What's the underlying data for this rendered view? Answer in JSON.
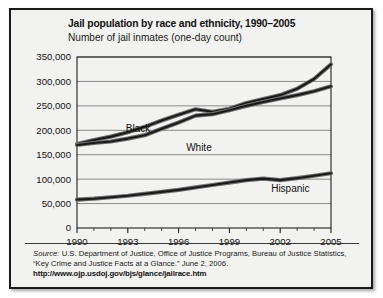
{
  "figure": {
    "title": "Jail population by race and ethnicity, 1990–2005",
    "subtitle": "Number of jail inmates (one-day count)"
  },
  "source": {
    "label": "Source:",
    "text": " U.S. Department of Justice, Office of Justice Programs, Bureau of Justice Statistics, “Key Crime and Justice Facts at a Glance.” June 2, 2006.",
    "url": "http://www.ojp.usdoj.gov/bjs/glance/jailrace.htm"
  },
  "chart_data": {
    "type": "line",
    "title": "Jail population by race and ethnicity, 1990–2005",
    "subtitle": "Number of jail inmates (one-day count)",
    "xlabel": "",
    "ylabel": "Number of jail inmates (one-day count)",
    "x": [
      1990,
      1991,
      1992,
      1993,
      1994,
      1995,
      1996,
      1997,
      1998,
      1999,
      2000,
      2001,
      2002,
      2003,
      2004,
      2005
    ],
    "xticks": [
      1990,
      1993,
      1996,
      1999,
      2002,
      2005
    ],
    "xtick_labels": [
      "1990",
      "1993",
      "1996",
      "1999",
      "2002",
      "2005"
    ],
    "xlim": [
      1990,
      2005
    ],
    "yticks": [
      0,
      50000,
      100000,
      150000,
      200000,
      250000,
      300000,
      350000
    ],
    "ytick_labels": [
      "0",
      "50,000",
      "100,000",
      "150,000",
      "200,000",
      "250,000",
      "300,000",
      "350,000"
    ],
    "ylim": [
      0,
      350000
    ],
    "grid": true,
    "legend": "inline-labels",
    "series": [
      {
        "name": "Black",
        "label": "Black",
        "color": "#1a1a1a",
        "values": [
          172000,
          180000,
          187000,
          196000,
          207000,
          220000,
          232000,
          243000,
          238000,
          244000,
          256000,
          264000,
          272000,
          285000,
          305000,
          335000
        ]
      },
      {
        "name": "White",
        "label": "White",
        "color": "#1a1a1a",
        "values": [
          170000,
          174000,
          177000,
          183000,
          190000,
          203000,
          216000,
          230000,
          233000,
          241000,
          250000,
          258000,
          265000,
          272000,
          280000,
          290000
        ]
      },
      {
        "name": "Hispanic",
        "label": "Hispanic",
        "color": "#1a1a1a",
        "values": [
          58000,
          60000,
          63000,
          66000,
          70000,
          74000,
          78000,
          83000,
          88000,
          93000,
          98000,
          101000,
          98000,
          102000,
          107000,
          112000
        ]
      }
    ]
  },
  "axis": {
    "ytick_labels": [
      "350,000",
      "300,000",
      "250,000",
      "200,000",
      "150,000",
      "100,000",
      "50,000",
      "0"
    ],
    "xtick_labels": [
      "1990",
      "1993",
      "1996",
      "1999",
      "2002",
      "2005"
    ]
  },
  "series_labels": {
    "black": "Black",
    "white": "White",
    "hispanic": "Hispanic"
  }
}
